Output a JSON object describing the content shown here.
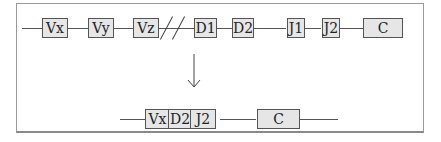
{
  "top_row": {
    "segments": [
      "Vx",
      "Vy",
      "Vz",
      "D1",
      "D2",
      "J1",
      "J2",
      "C"
    ]
  },
  "bottom_row": {
    "segments": [
      "Vx",
      "D2",
      "J2",
      "C"
    ]
  },
  "arrow": {
    "direction": "down"
  }
}
